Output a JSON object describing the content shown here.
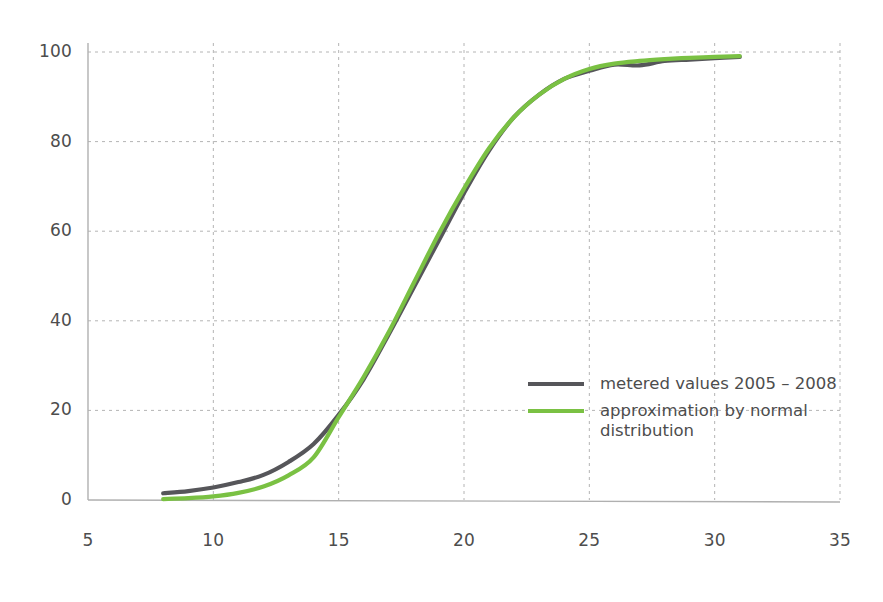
{
  "chart_data": {
    "type": "line",
    "title": "",
    "xlabel": "",
    "ylabel": "",
    "xlim": [
      5,
      35
    ],
    "ylim": [
      0,
      100
    ],
    "xticks": [
      5,
      10,
      15,
      20,
      25,
      30,
      35
    ],
    "yticks": [
      0,
      20,
      40,
      60,
      80,
      100
    ],
    "grid": true,
    "legend_position": "center-right",
    "colors": {
      "metered": "#56565a",
      "approximation": "#7ac143",
      "grid": "#b4b4b4",
      "axis": "#b0b0b0",
      "text": "#4d4d4d"
    },
    "x": [
      8,
      9,
      10,
      11,
      12,
      13,
      14,
      15,
      16,
      17,
      18,
      19,
      20,
      21,
      22,
      23,
      24,
      25,
      26,
      27,
      28,
      29,
      30,
      31
    ],
    "series": [
      {
        "name": "metered values 2005 – 2008",
        "color": "#56565a",
        "values": [
          1.5,
          2.0,
          2.8,
          4.0,
          5.6,
          8.5,
          12.5,
          19.0,
          27.0,
          37.0,
          47.5,
          58.0,
          68.5,
          78.0,
          85.5,
          90.5,
          94.0,
          95.8,
          97.2,
          97.0,
          98.0,
          98.3,
          98.6,
          98.9
        ]
      },
      {
        "name": "approximation by normal distribution",
        "color": "#7ac143",
        "values": [
          0.2,
          0.4,
          0.8,
          1.6,
          3.0,
          5.5,
          9.5,
          18.5,
          27.5,
          37.5,
          48.5,
          59.5,
          69.5,
          78.5,
          85.5,
          90.5,
          94.0,
          96.2,
          97.4,
          98.0,
          98.4,
          98.7,
          98.9,
          99.1
        ]
      }
    ]
  },
  "legend": {
    "items": [
      {
        "label": "metered values 2005 – 2008",
        "color": "#56565a"
      },
      {
        "label": "approximation by normal\ndistribution",
        "color": "#7ac143"
      }
    ]
  },
  "axes": {
    "y_tick_labels": [
      "100",
      "80",
      "60",
      "40",
      "20",
      "0"
    ],
    "x_tick_labels": [
      "5",
      "10",
      "15",
      "20",
      "25",
      "30",
      "35"
    ]
  }
}
